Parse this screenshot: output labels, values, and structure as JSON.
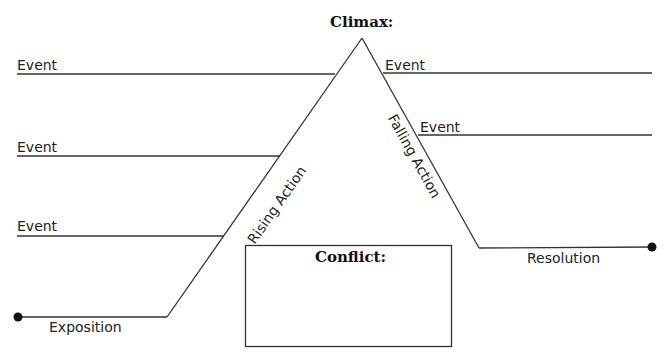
{
  "diagram": {
    "type": "plot-diagram",
    "line_color": "#333333",
    "climax": {
      "label": "Climax:"
    },
    "conflict": {
      "label": "Conflict:"
    },
    "rising_action": {
      "label": "Rising Action"
    },
    "falling_action": {
      "label": "Falling Action"
    },
    "exposition": {
      "label": "Exposition"
    },
    "resolution": {
      "label": "Resolution"
    },
    "left_events": [
      {
        "label": "Event"
      },
      {
        "label": "Event"
      },
      {
        "label": "Event"
      }
    ],
    "right_events": [
      {
        "label": "Event"
      },
      {
        "label": "Event"
      }
    ]
  }
}
